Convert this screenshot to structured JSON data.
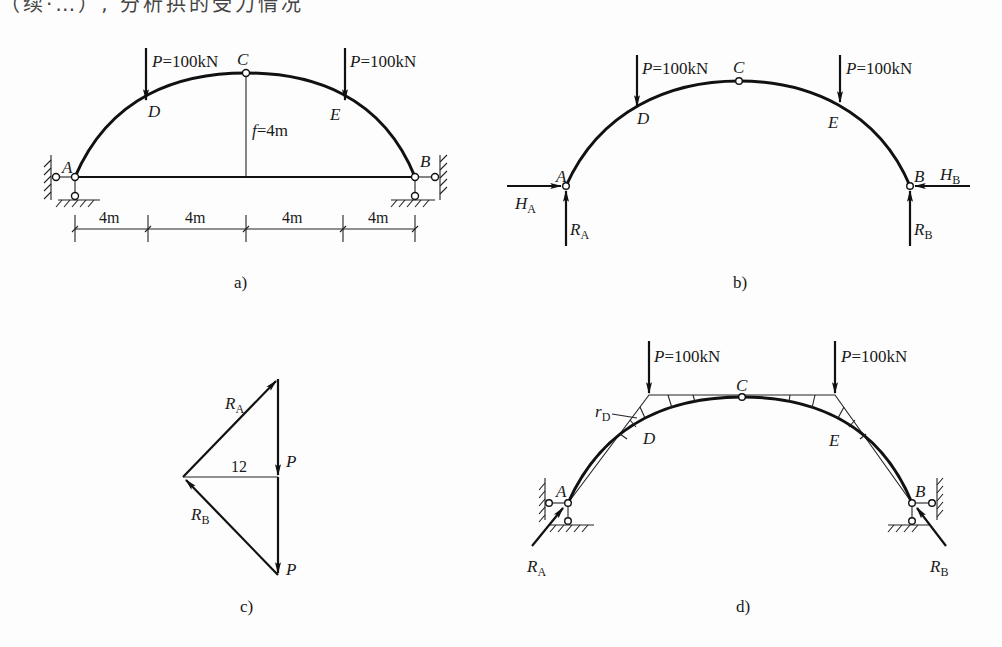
{
  "header_fragment": "（续·…）, 分析拱的受力情况",
  "panels": {
    "a": {
      "caption": "a)",
      "loads": [
        {
          "label_var": "P",
          "label_val": "=100kN"
        },
        {
          "label_var": "P",
          "label_val": "=100kN"
        }
      ],
      "nodes": {
        "A": "A",
        "B": "B",
        "C": "C",
        "D": "D",
        "E": "E"
      },
      "rise_label_var": "f",
      "rise_label_val": "=4m",
      "spans": [
        "4m",
        "4m",
        "4m",
        "4m"
      ]
    },
    "b": {
      "caption": "b)",
      "loads": [
        {
          "label_var": "P",
          "label_val": "=100kN"
        },
        {
          "label_var": "P",
          "label_val": "=100kN"
        }
      ],
      "nodes": {
        "A": "A",
        "B": "B",
        "C": "C",
        "D": "D",
        "E": "E"
      },
      "reactions": {
        "HA": {
          "var": "H",
          "sub": "A"
        },
        "RA": {
          "var": "R",
          "sub": "A"
        },
        "HB": {
          "var": "H",
          "sub": "B"
        },
        "RB": {
          "var": "R",
          "sub": "B"
        }
      }
    },
    "c": {
      "caption": "c)",
      "labels": {
        "RA": {
          "var": "R",
          "sub": "A"
        },
        "RB": {
          "var": "R",
          "sub": "B"
        },
        "P1": "P",
        "P2": "P",
        "pole_distance": "12"
      }
    },
    "d": {
      "caption": "d)",
      "loads": [
        {
          "label_var": "P",
          "label_val": "=100kN"
        },
        {
          "label_var": "P",
          "label_val": "=100kN"
        }
      ],
      "nodes": {
        "A": "A",
        "B": "B",
        "C": "C",
        "D": "D",
        "E": "E"
      },
      "rD": {
        "var": "r",
        "sub": "D"
      },
      "reactions": {
        "RA": {
          "var": "R",
          "sub": "A"
        },
        "RB": {
          "var": "R",
          "sub": "B"
        }
      }
    }
  }
}
